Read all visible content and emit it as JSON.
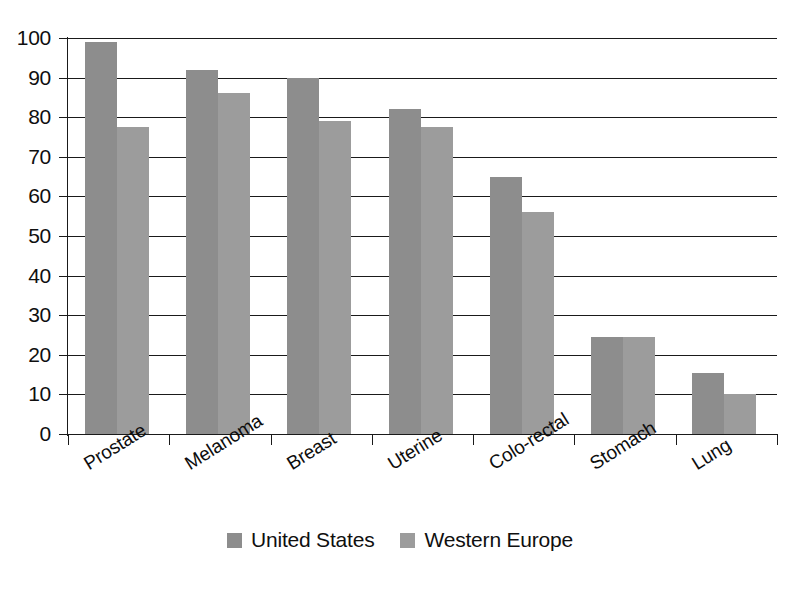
{
  "chart_data": {
    "type": "bar",
    "title": "",
    "subtitle": "",
    "xlabel": "",
    "ylabel": "",
    "ylim": [
      0,
      100
    ],
    "yticks": [
      0,
      10,
      20,
      30,
      40,
      50,
      60,
      70,
      80,
      90,
      100
    ],
    "ytick_labels": [
      "0",
      "10",
      "20",
      "30",
      "40",
      "50",
      "60",
      "70",
      "80",
      "90",
      "100"
    ],
    "grid": true,
    "grid_axis": "y",
    "legend_position": "bottom-center",
    "categories": [
      "Prostate",
      "Melanoma",
      "Breast",
      "Uterine",
      "Colo-rectal",
      "Stomach",
      "Lung"
    ],
    "series": [
      {
        "name": "United States",
        "color": "#8d8d8d",
        "values": [
          99,
          92,
          90,
          82,
          65,
          24.5,
          15.5
        ]
      },
      {
        "name": "Western Europe",
        "color": "#9c9c9c",
        "values": [
          77.5,
          86,
          79,
          77.5,
          56,
          24.5,
          10
        ]
      }
    ]
  },
  "legend": {
    "items": [
      {
        "label": "United States",
        "color": "#8d8d8d"
      },
      {
        "label": "Western Europe",
        "color": "#9c9c9c"
      }
    ]
  },
  "axis": {
    "line_color": "#1a1a1a",
    "text_color": "#0f0f0f"
  }
}
